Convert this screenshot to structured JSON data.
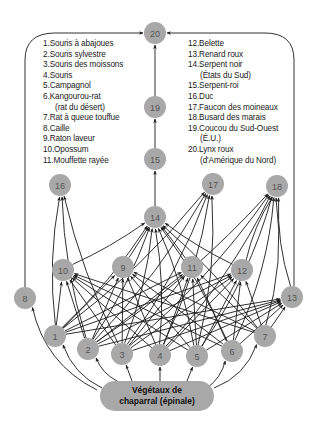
{
  "legend": {
    "left": [
      {
        "num": "1.",
        "label": "Souris à abajoues"
      },
      {
        "num": "2.",
        "label": "Souris sylvestre"
      },
      {
        "num": "3.",
        "label": "Souris des moissons"
      },
      {
        "num": "4.",
        "label": "Souris"
      },
      {
        "num": "5.",
        "label": "Campagnol"
      },
      {
        "num": "6.",
        "label": "Kangourou-rat",
        "cont": "(rat du désert)"
      },
      {
        "num": "7.",
        "label": "Rat à queue touffue"
      },
      {
        "num": "8.",
        "label": "Caille"
      },
      {
        "num": "9.",
        "label": "Raton laveur"
      },
      {
        "num": "10.",
        "label": "Opossum"
      },
      {
        "num": "11.",
        "label": "Mouffette rayée"
      }
    ],
    "right": [
      {
        "num": "12.",
        "label": "Belette"
      },
      {
        "num": "13.",
        "label": "Renard roux"
      },
      {
        "num": "14.",
        "label": "Serpent noir",
        "cont": "(États du Sud)"
      },
      {
        "num": "15.",
        "label": "Serpent-roi"
      },
      {
        "num": "16.",
        "label": "Duc"
      },
      {
        "num": "17.",
        "label": "Faucon des moineaux"
      },
      {
        "num": "18.",
        "label": "Busard des marais"
      },
      {
        "num": "19.",
        "label": "Coucou du Sud-Ouest",
        "cont": "(É.U.)"
      },
      {
        "num": "20.",
        "label": "Lynx roux",
        "cont": "(d'Amérique du Nord)"
      }
    ]
  },
  "producer": {
    "line1": "Végétaux de",
    "line2": "chaparral (épinale)"
  },
  "nodes": [
    {
      "id": "1",
      "x": 55,
      "y": 336
    },
    {
      "id": "2",
      "x": 88,
      "y": 349
    },
    {
      "id": "3",
      "x": 122,
      "y": 354
    },
    {
      "id": "4",
      "x": 160,
      "y": 355
    },
    {
      "id": "5",
      "x": 197,
      "y": 356
    },
    {
      "id": "6",
      "x": 232,
      "y": 351
    },
    {
      "id": "7",
      "x": 265,
      "y": 336
    },
    {
      "id": "8",
      "x": 25,
      "y": 298
    },
    {
      "id": "9",
      "x": 123,
      "y": 267
    },
    {
      "id": "10",
      "x": 63,
      "y": 270
    },
    {
      "id": "11",
      "x": 192,
      "y": 267
    },
    {
      "id": "12",
      "x": 242,
      "y": 270
    },
    {
      "id": "13",
      "x": 292,
      "y": 297
    },
    {
      "id": "14",
      "x": 155,
      "y": 217
    },
    {
      "id": "15",
      "x": 155,
      "y": 159
    },
    {
      "id": "16",
      "x": 60,
      "y": 185
    },
    {
      "id": "17",
      "x": 213,
      "y": 184
    },
    {
      "id": "18",
      "x": 277,
      "y": 186
    },
    {
      "id": "19",
      "x": 155,
      "y": 107
    },
    {
      "id": "20",
      "x": 155,
      "y": 33
    }
  ],
  "colors": {
    "node_fill": "#a8a8a8",
    "edge": "#1a1a1a",
    "producer_fill": "#a8a8a8"
  }
}
